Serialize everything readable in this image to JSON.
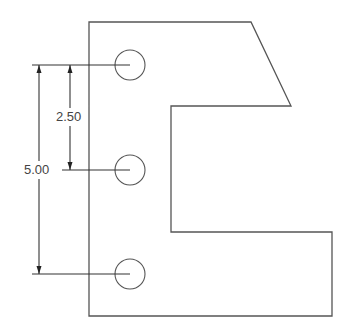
{
  "drawing": {
    "type": "engineering-drawing",
    "part_outline": [
      [
        89,
        22
      ],
      [
        251,
        22
      ],
      [
        291,
        106
      ],
      [
        171,
        106
      ],
      [
        171,
        232
      ],
      [
        332,
        232
      ],
      [
        332,
        316
      ],
      [
        89,
        316
      ]
    ],
    "holes": [
      {
        "id": "hole-top",
        "cx": 130,
        "cy": 65,
        "r": 15
      },
      {
        "id": "hole-middle",
        "cx": 130,
        "cy": 170,
        "r": 15
      },
      {
        "id": "hole-bottom",
        "cx": 130,
        "cy": 274,
        "r": 15
      }
    ],
    "dimensions": [
      {
        "id": "dim-2-50",
        "label": "2.50",
        "from": "hole-top",
        "to": "hole-middle",
        "x": 70
      },
      {
        "id": "dim-5-00",
        "label": "5.00",
        "from": "hole-top",
        "to": "hole-bottom",
        "x": 39
      }
    ],
    "colors": {
      "outline": "#555555",
      "lines": "#333333",
      "text": "#444444",
      "background": "#ffffff"
    }
  }
}
